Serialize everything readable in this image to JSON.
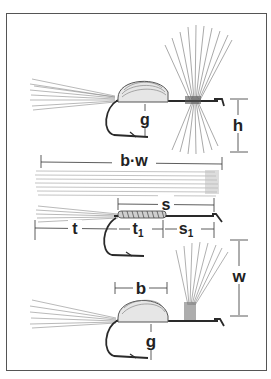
{
  "figure": {
    "labels": {
      "top_gap": "g",
      "top_height": "h",
      "hackle_span": "b·w",
      "shank": "s",
      "tail": "t",
      "body": "t",
      "body_sub": "1",
      "eye_section": "s",
      "eye_section_sub": "1",
      "wing_height": "w",
      "bottom_body": "b",
      "bottom_gap": "g"
    },
    "colors": {
      "ink": "#2a2a2a",
      "fiber": "#8a8a8a",
      "frame": "#555555"
    }
  }
}
